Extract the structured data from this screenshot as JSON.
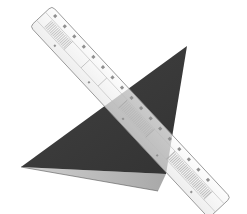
{
  "scene": {
    "description": "Photo of a dark grey triangular set square with a lighter folded underside, overlapped diagonally by a transparent ruler",
    "background": "#ffffff",
    "objects": [
      {
        "name": "triangle",
        "color_dark": "#3d3d3d",
        "color_fold": "#b9b9b9"
      },
      {
        "name": "ruler",
        "color_body": "#f4f4f4",
        "color_edge": "#8a8a8a",
        "color_ticks": "#9a9a9a"
      }
    ]
  }
}
